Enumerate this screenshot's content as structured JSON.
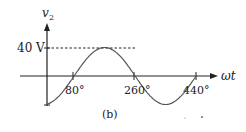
{
  "figure": {
    "caption": "(b)",
    "y_axis_label": "v",
    "y_axis_subscript": "2",
    "x_axis_label": "ωt",
    "peak_label": "40 V",
    "x_ticks": [
      "80°",
      "260°",
      "440°"
    ]
  },
  "chart_data": {
    "type": "line",
    "title": "",
    "xlabel": "ωt",
    "ylabel": "v2",
    "annotations": [
      "40 V",
      "(b)"
    ],
    "x_ticks": [
      80,
      260,
      440
    ],
    "x_tick_labels": [
      "80°",
      "260°",
      "440°"
    ],
    "amplitude": 40,
    "phase_shift_deg": -80,
    "equation": "v2 = 40 sin(ωt - 80°)",
    "series": [
      {
        "name": "v2",
        "x": [
          0,
          80,
          170,
          260,
          350,
          440
        ],
        "values": [
          -39.4,
          0,
          40,
          0,
          -40,
          0
        ]
      }
    ],
    "grid": false
  }
}
